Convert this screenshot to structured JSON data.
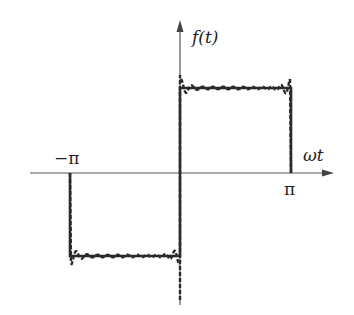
{
  "diagram": {
    "labels": {
      "y_axis": "f(t)",
      "x_axis": "ωt",
      "neg_pi": "−π",
      "pos_pi": "π"
    },
    "colors": {
      "axis": "#555555",
      "curve": "#2a2a2a",
      "background": "#ffffff"
    },
    "geometry": {
      "origin_x": 180,
      "axis_y": 173,
      "neg_pi_x": 70,
      "pos_pi_x": 291,
      "upper_level_y": 88,
      "lower_level_y": 256
    },
    "curves": [
      {
        "name": "ideal-square-wave",
        "style": "solid"
      },
      {
        "name": "fourier-partial-sum",
        "style": "dashed",
        "ripple": true
      }
    ]
  }
}
